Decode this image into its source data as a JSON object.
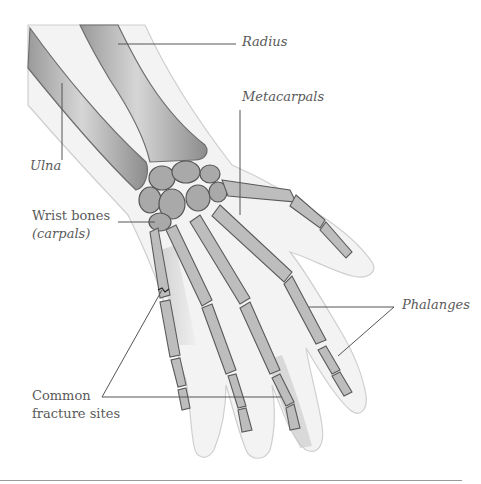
{
  "diagram": {
    "labels": {
      "radius": "Radius",
      "ulna": "Ulna",
      "metacarpals": "Metacarpals",
      "wrist_bones": "Wrist bones",
      "wrist_bones_sub": "(carpals)",
      "phalanges": "Phalanges",
      "fracture_line1": "Common",
      "fracture_line2": "fracture sites"
    }
  }
}
